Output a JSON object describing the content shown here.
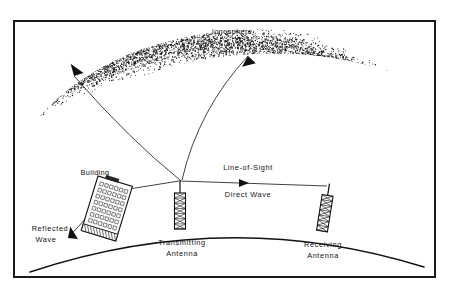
{
  "figure": {
    "type": "technical-diagram",
    "border_color": "#1a1a1a",
    "ink_color": "#111111",
    "background_color": "#ffffff"
  },
  "labels": {
    "ionosphere": "Ionosphere",
    "building": "Building",
    "line_of_sight": "Line-of-Sight",
    "direct_wave": "Direct  Wave",
    "reflected_wave_line1": "Reflected",
    "reflected_wave_line2": "Wave",
    "transmitting_antenna_line1": "Transmitting",
    "transmitting_antenna_line2": "Antenna",
    "receiving_antenna_line1": "Receiving",
    "receiving_antenna_line2": "Antenna"
  },
  "elements": {
    "frame": {
      "name": "diagram-border",
      "x": 14,
      "y": 21,
      "width": 421,
      "height": 256
    },
    "ionosphere_band": {
      "name": "ionosphere-stipple-band",
      "description": "Stippled arc band representing the ionized layer",
      "stipple_color": "#1a1a1a"
    },
    "earth_curve": {
      "name": "earth-surface-curve",
      "description": "Curved line representing the earth's surface",
      "start": [
        30,
        272
      ],
      "apex": [
        228,
        226
      ],
      "end": [
        424,
        267
      ]
    },
    "transmitting_antenna": {
      "name": "transmitting-antenna",
      "description": "Vertical lattice tower with X bracing",
      "base": [
        180,
        227
      ],
      "top": [
        180,
        180
      ]
    },
    "receiving_antenna": {
      "name": "receiving-antenna",
      "description": "Tilted lattice tower normal to earth surface",
      "base": [
        322,
        231
      ],
      "top": [
        329,
        184
      ]
    },
    "building_block": {
      "name": "building",
      "description": "Tilted rectangular building with window grid",
      "window_columns": 6,
      "window_rows": 7,
      "tilt_degrees": 17
    },
    "rays": {
      "skywave_left": {
        "name": "skywave-ray-left",
        "arrow_at": [
          70,
          72
        ]
      },
      "skywave_right": {
        "name": "skywave-ray-right",
        "arrow_at": [
          250,
          51
        ]
      },
      "direct_wave": {
        "name": "direct-wave-ray",
        "arrow_at": [
          245,
          178
        ]
      },
      "reflected_wave": {
        "name": "reflected-wave-ray",
        "arrow_at": [
          66,
          240
        ]
      }
    }
  }
}
